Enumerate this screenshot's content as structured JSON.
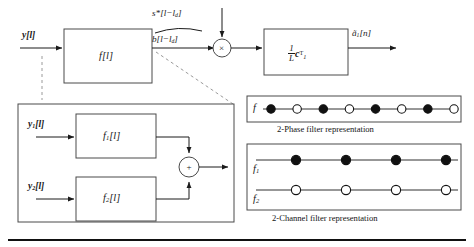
{
  "figure": {
    "background": "#ffffff",
    "line_color": "#1a1a1a",
    "dashed_color": "#8a8a8a"
  },
  "top_path": {
    "input_label": "y[l]",
    "filter_block_label": "f[l]",
    "brace_top_label": "s*[l−l",
    "brace_top_label_sub": "d",
    "brace_top_label_tail": "]",
    "brace_bottom_label": "b[l−l",
    "brace_bottom_label_sub": "d",
    "brace_bottom_label_tail": "]",
    "multiplier_symbol": "×",
    "gain_block_numerator": "1",
    "gain_block_denominator": "L",
    "gain_block_vector": "c",
    "gain_block_vector_sub": "1",
    "gain_block_vector_sup": "T",
    "output_label": "ã",
    "output_label_sub": "1",
    "output_label_tail": "[n]"
  },
  "lower_box": {
    "input_1_label": "y",
    "input_1_sub": "1",
    "input_1_tail": "[l]",
    "input_2_label": "y",
    "input_2_sub": "2",
    "input_2_tail": "[l]",
    "block_1_label": "f",
    "block_1_sub": "1",
    "block_1_tail": "[l]",
    "block_2_label": "f",
    "block_2_sub": "2",
    "block_2_tail": "[l]",
    "adder_symbol": "+"
  },
  "two_phase_panel": {
    "row_label": "f",
    "caption": "2-Phase filter representation",
    "markers": [
      "filled",
      "open",
      "filled",
      "open",
      "filled",
      "open",
      "filled",
      "open"
    ]
  },
  "two_channel_panel": {
    "row_1_label": "f",
    "row_1_sub": "1",
    "row_2_label": "f",
    "row_2_sub": "2",
    "caption": "2-Channel filter representation",
    "row_1_markers": [
      "filled",
      "filled",
      "filled",
      "filled"
    ],
    "row_2_markers": [
      "open",
      "open",
      "open",
      "open"
    ]
  }
}
